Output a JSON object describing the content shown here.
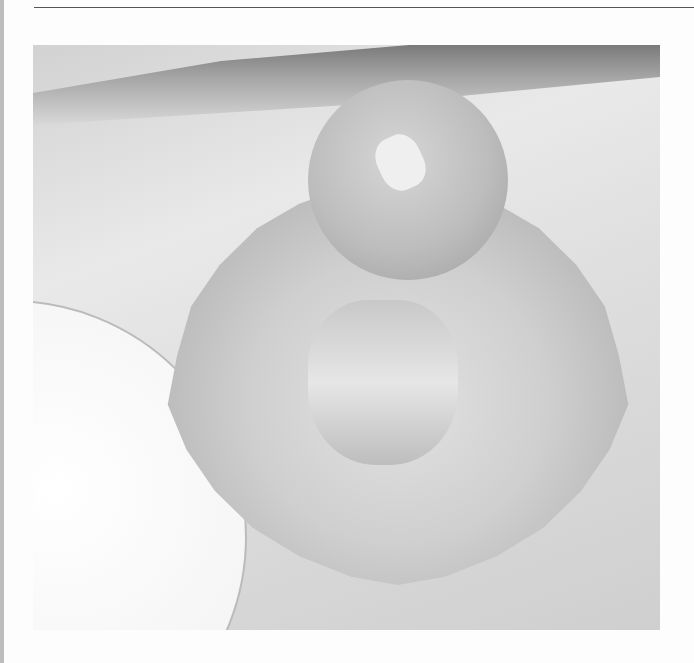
{
  "image": {
    "description": "Grayscale photograph of a scoop of ice cream in a footed glass dessert dish with scalloped rim, on a white surface beside a white plate",
    "colors": {
      "background": "#fdfdfd",
      "rule_line": "#555555",
      "left_border": "#bdbdbd"
    }
  }
}
